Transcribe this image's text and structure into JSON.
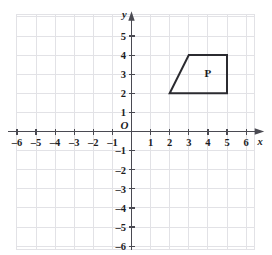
{
  "figure": {
    "type": "coordinate-grid",
    "background_color": "#ffffff",
    "grid_color": "#e2e2e6",
    "axis_color": "#4a4a52",
    "shape_color": "#2b2b30"
  },
  "chart_data": {
    "type": "scatter",
    "title": "",
    "xlabel": "x",
    "ylabel": "y",
    "xlim": [
      -6.6,
      6.6
    ],
    "ylim": [
      -6.2,
      5.8
    ],
    "grid": true,
    "legend": "none",
    "x_ticks": [
      -6,
      -5,
      -4,
      -3,
      -2,
      -1,
      1,
      2,
      3,
      4,
      5,
      6
    ],
    "x_tick_labels": [
      "-6",
      "-5",
      "-4",
      "-3",
      "-2",
      "-1",
      "1",
      "2",
      "3",
      "4",
      "5",
      "6"
    ],
    "y_ticks": [
      5,
      4,
      3,
      2,
      1,
      -1,
      -2,
      -3,
      -4,
      -5,
      -6
    ],
    "y_tick_labels": [
      "5",
      "4",
      "3",
      "2",
      "1",
      "-1",
      "-2",
      "-3",
      "-4",
      "-5",
      "-6"
    ],
    "origin_label": "O",
    "shapes": [
      {
        "name": "P",
        "label": "P",
        "kind": "trapezoid",
        "vertices": [
          [
            2,
            2
          ],
          [
            3,
            4
          ],
          [
            5,
            4
          ],
          [
            5,
            2
          ]
        ],
        "label_position": [
          4,
          3
        ],
        "filled": false
      }
    ],
    "annotations": [
      {
        "text": "P",
        "x": 4,
        "y": 3
      }
    ]
  },
  "axes": {
    "x_axis_name": "x",
    "y_axis_name": "y",
    "origin": "O"
  }
}
